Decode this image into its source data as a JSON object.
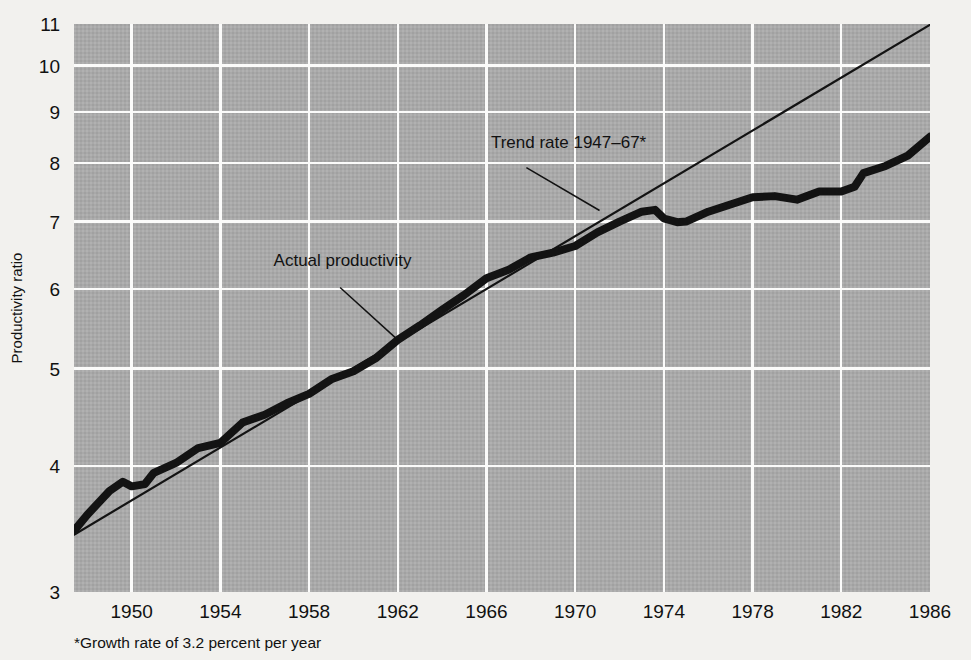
{
  "chart_data": {
    "type": "line",
    "title": "",
    "xlabel": "",
    "ylabel": "Productivity ratio",
    "yscale": "log",
    "ylim": [
      3,
      11
    ],
    "xlim": [
      1947.4,
      1986
    ],
    "grid": true,
    "legend_position": "inline-annotations",
    "y_ticks": [
      3,
      4,
      5,
      6,
      7,
      8,
      9,
      10,
      11
    ],
    "y_tick_labels": [
      "3",
      "4",
      "5",
      "6",
      "7",
      "8",
      "9",
      "10",
      "11"
    ],
    "x_ticks": [
      1950,
      1954,
      1958,
      1962,
      1966,
      1970,
      1974,
      1978,
      1982,
      1986
    ],
    "x_tick_labels": [
      "1950",
      "1954",
      "1958",
      "1962",
      "1966",
      "1970",
      "1974",
      "1978",
      "1982",
      "1986"
    ],
    "footnote": "*Growth rate of 3.2 percent per year",
    "annotations": [
      {
        "name": "actual-productivity",
        "text": "Actual productivity",
        "text_x": 1956.4,
        "text_y": 6.32,
        "leader_from": [
          1959.4,
          6.02
        ],
        "leader_to": [
          1962.0,
          5.34
        ]
      },
      {
        "name": "trend-rate",
        "text": "Trend rate 1947–67*",
        "text_x": 1966.2,
        "text_y": 8.28,
        "leader_from": [
          1967.8,
          7.92
        ],
        "leader_to": [
          1971.1,
          7.18
        ]
      }
    ],
    "series": [
      {
        "name": "Actual productivity",
        "style": "thick",
        "x": [
          1947.4,
          1948,
          1949,
          1949.6,
          1950,
          1950.6,
          1951,
          1952,
          1953,
          1954,
          1955,
          1956,
          1957,
          1958,
          1959,
          1960,
          1961,
          1962,
          1963,
          1964,
          1965,
          1966,
          1967,
          1968,
          1969,
          1970,
          1971,
          1972,
          1973,
          1973.6,
          1974,
          1974.6,
          1975,
          1976,
          1977,
          1978,
          1979,
          1980,
          1981,
          1982,
          1982.6,
          1983,
          1984,
          1985,
          1986
        ],
        "y": [
          3.45,
          3.58,
          3.78,
          3.86,
          3.82,
          3.84,
          3.94,
          4.03,
          4.17,
          4.22,
          4.42,
          4.5,
          4.62,
          4.72,
          4.88,
          4.97,
          5.12,
          5.34,
          5.52,
          5.72,
          5.92,
          6.15,
          6.27,
          6.45,
          6.52,
          6.62,
          6.83,
          7.0,
          7.16,
          7.19,
          7.05,
          6.99,
          7.0,
          7.16,
          7.28,
          7.4,
          7.42,
          7.36,
          7.5,
          7.5,
          7.58,
          7.82,
          7.95,
          8.14,
          8.5
        ]
      },
      {
        "name": "Trend rate 1947–67",
        "style": "thin",
        "x": [
          1947.4,
          1986
        ],
        "y": [
          3.42,
          10.98
        ]
      }
    ]
  },
  "axis": {
    "y_title": "Productivity ratio"
  }
}
